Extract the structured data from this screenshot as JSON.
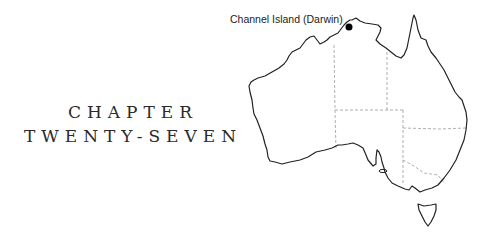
{
  "chapter": {
    "line1": "CHAPTER",
    "line2": "TWENTY-SEVEN"
  },
  "map": {
    "region": "Australia",
    "marker_label": "Channel Island (Darwin)",
    "marker_color": "#000000",
    "outline_color": "#222222",
    "border_color": "#999999"
  }
}
